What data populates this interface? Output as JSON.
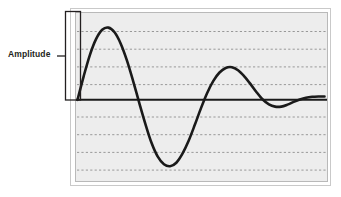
{
  "figure": {
    "title": "",
    "annotation": {
      "label": "Amplitude",
      "leader_line": true
    },
    "colors": {
      "plot_background": "#ededed",
      "plot_border_outer": "#c8c8c8",
      "plot_border_inner": "#b4b4b4",
      "gridline": "#8c8c8c",
      "axis_line": "#1a1a1a",
      "curve": "#1a1a1a",
      "bracket": "#231f20",
      "text": "#231f20",
      "page_background": "#ffffff"
    }
  },
  "chart_data": {
    "type": "line",
    "title": "",
    "subtitle": "",
    "xlabel": "",
    "ylabel": "Amplitude",
    "legend": [],
    "legend_position": "none",
    "grid": true,
    "gridlines_y": [
      -4,
      -3,
      -2,
      -1,
      1,
      2,
      3,
      4
    ],
    "axis_zero_line": 0,
    "xlim": [
      0,
      10
    ],
    "ylim": [
      -4.8,
      4.8
    ],
    "x_tick_labels": [],
    "y_tick_labels": [],
    "annotations": [
      {
        "text": "Amplitude",
        "type": "bracket",
        "spans_y": [
          0,
          4.8
        ],
        "at_x": 0.05
      }
    ],
    "series": [
      {
        "name": "damped oscillation",
        "description": "Decaying sine-like waveform: large positive peak, deeper negative trough, smaller positive peak, small negative dip, flattening toward zero",
        "x": [
          0.0,
          0.25,
          0.5,
          0.75,
          1.0,
          1.25,
          1.5,
          1.75,
          2.0,
          2.25,
          2.5,
          2.75,
          3.0,
          3.25,
          3.5,
          3.75,
          4.0,
          4.25,
          4.5,
          4.75,
          5.0,
          5.25,
          5.5,
          5.75,
          6.0,
          6.25,
          6.5,
          6.75,
          7.0,
          7.25,
          7.5,
          7.75,
          8.0,
          8.25,
          8.5,
          8.75,
          9.0,
          9.25,
          9.5,
          9.75,
          10.0
        ],
        "y": [
          0.0,
          1.55,
          2.95,
          4.0,
          4.62,
          4.76,
          4.45,
          3.7,
          2.6,
          1.25,
          -0.2,
          -1.6,
          -2.85,
          -3.75,
          -4.25,
          -4.38,
          -4.15,
          -3.55,
          -2.7,
          -1.65,
          -0.55,
          0.45,
          1.25,
          1.8,
          2.1,
          2.15,
          1.95,
          1.55,
          1.05,
          0.5,
          0.02,
          -0.3,
          -0.45,
          -0.45,
          -0.32,
          -0.14,
          0.02,
          0.14,
          0.2,
          0.22,
          0.22
        ],
        "color": "#1a1a1a",
        "linewidth": 2.6
      }
    ]
  }
}
